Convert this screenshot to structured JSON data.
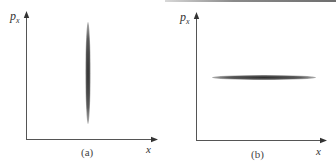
{
  "figure": {
    "panels": [
      {
        "id": "a",
        "caption": "(a)",
        "y_axis_label": "p",
        "y_axis_label_sub": "x",
        "x_axis_label": "x",
        "shape": "narrow vertical ellipse (small spread in x, large spread in p_x)"
      },
      {
        "id": "b",
        "caption": "(b)",
        "y_axis_label": "p",
        "y_axis_label_sub": "x",
        "x_axis_label": "x",
        "shape": "narrow horizontal ellipse (large spread in x, small spread in p_x)"
      }
    ],
    "colors": {
      "axis": "#555555",
      "ellipse_dark": "#3a3a3a",
      "ellipse_light": "#9a9a9a",
      "text": "#333333"
    }
  }
}
